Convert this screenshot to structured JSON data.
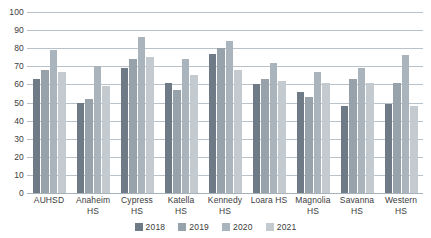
{
  "chart_data": {
    "type": "bar",
    "title": "",
    "xlabel": "",
    "ylabel": "",
    "ylim": [
      0,
      100
    ],
    "yticks": [
      0,
      10,
      20,
      30,
      40,
      50,
      60,
      70,
      80,
      90,
      100
    ],
    "grid": true,
    "legend_position": "bottom-center",
    "categories": [
      "AUHSD",
      "Anaheim HS",
      "Cypress HS",
      "Katella HS",
      "Kennedy HS",
      "Loara HS",
      "Magnolia HS",
      "Savanna HS",
      "Western HS"
    ],
    "category_lines": [
      [
        "AUHSD"
      ],
      [
        "Anaheim",
        "HS"
      ],
      [
        "Cypress",
        "HS"
      ],
      [
        "Katella",
        "HS"
      ],
      [
        "Kennedy",
        "HS"
      ],
      [
        "Loara HS"
      ],
      [
        "Magnolia",
        "HS"
      ],
      [
        "Savanna",
        "HS"
      ],
      [
        "Western",
        "HS"
      ]
    ],
    "series": [
      {
        "name": "2018",
        "color": "#6e7a86",
        "values": [
          63,
          50,
          69,
          61,
          77,
          60,
          56,
          48,
          49
        ]
      },
      {
        "name": "2019",
        "color": "#97a2ab",
        "values": [
          68,
          52,
          74,
          57,
          80,
          63,
          53,
          63,
          61
        ]
      },
      {
        "name": "2020",
        "color": "#aab4bc",
        "values": [
          79,
          70,
          86,
          74,
          84,
          72,
          67,
          69,
          76
        ]
      },
      {
        "name": "2021",
        "color": "#c3cbd1",
        "values": [
          67,
          59,
          75,
          65,
          68,
          62,
          61,
          61,
          48
        ]
      }
    ]
  },
  "legend": {
    "items": [
      {
        "label": "2018"
      },
      {
        "label": "2019"
      },
      {
        "label": "2020"
      },
      {
        "label": "2021"
      }
    ]
  }
}
